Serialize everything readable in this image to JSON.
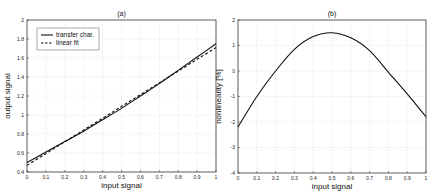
{
  "chart_data": [
    {
      "id": "a",
      "type": "line",
      "title": "(a)",
      "xlabel": "input signal",
      "ylabel": "output signal",
      "xlim": [
        0,
        1
      ],
      "ylim": [
        0.4,
        2
      ],
      "xticks": [
        "0",
        "0.1",
        "0.2",
        "0.3",
        "0.4",
        "0.5",
        "0.6",
        "0.7",
        "0.8",
        "0.9",
        "1"
      ],
      "yticks": [
        "0.4",
        "0.6",
        "0.8",
        "1",
        "1.2",
        "1.4",
        "1.6",
        "1.8",
        "2"
      ],
      "grid": true,
      "legend": {
        "position": "upper left",
        "entries": [
          "transfer char.",
          "linear fit"
        ]
      },
      "x": [
        0,
        0.1,
        0.2,
        0.3,
        0.4,
        0.5,
        0.6,
        0.7,
        0.8,
        0.9,
        1.0
      ],
      "series": [
        {
          "name": "transfer char.",
          "style": "solid",
          "values": [
            0.5,
            0.61,
            0.72,
            0.83,
            0.95,
            1.07,
            1.2,
            1.33,
            1.47,
            1.61,
            1.75
          ]
        },
        {
          "name": "linear fit",
          "style": "dashed",
          "values": [
            0.47,
            0.594,
            0.718,
            0.842,
            0.966,
            1.09,
            1.214,
            1.338,
            1.462,
            1.586,
            1.71
          ]
        }
      ]
    },
    {
      "id": "b",
      "type": "line",
      "title": "(b)",
      "xlabel": "input signal",
      "ylabel": "nonlinearity [%]",
      "xlim": [
        0,
        1
      ],
      "ylim": [
        -4,
        2
      ],
      "xticks": [
        "0",
        "0.1",
        "0.2",
        "0.3",
        "0.4",
        "0.5",
        "0.6",
        "0.7",
        "0.8",
        "0.9",
        "1"
      ],
      "yticks": [
        "-4",
        "-3",
        "-2",
        "-1",
        "0",
        "1",
        "2"
      ],
      "grid": true,
      "x": [
        0,
        0.1,
        0.2,
        0.3,
        0.4,
        0.5,
        0.6,
        0.7,
        0.8,
        0.9,
        1.0
      ],
      "series": [
        {
          "name": "nonlinearity",
          "style": "solid",
          "values": [
            -2.2,
            -1.0,
            0.0,
            0.85,
            1.35,
            1.5,
            1.3,
            0.8,
            -0.05,
            -0.9,
            -1.8
          ]
        }
      ]
    }
  ]
}
